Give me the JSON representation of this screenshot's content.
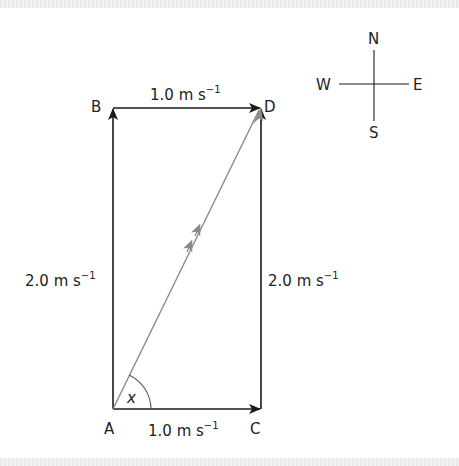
{
  "diagram": {
    "points": {
      "A": {
        "label": "A",
        "x": 113,
        "y": 409
      },
      "B": {
        "label": "B",
        "x": 113,
        "y": 108
      },
      "C": {
        "label": "C",
        "x": 261,
        "y": 409
      },
      "D": {
        "label": "D",
        "x": 261,
        "y": 108
      }
    },
    "vectors": [
      {
        "from": "A",
        "to": "B",
        "magnitude": "2.0",
        "unit": "m s",
        "exponent": "−1"
      },
      {
        "from": "B",
        "to": "D",
        "magnitude": "1.0",
        "unit": "m s",
        "exponent": "−1"
      },
      {
        "from": "A",
        "to": "C",
        "magnitude": "1.0",
        "unit": "m s",
        "exponent": "−1"
      },
      {
        "from": "C",
        "to": "D",
        "magnitude": "2.0",
        "unit": "m s",
        "exponent": "−1"
      },
      {
        "from": "A",
        "to": "D",
        "magnitude": "",
        "unit": "",
        "exponent": "",
        "style": "resultant"
      }
    ],
    "angle_label": "x",
    "compass": {
      "N": "N",
      "S": "S",
      "E": "E",
      "W": "W"
    },
    "colors": {
      "line": "#1a1a1a",
      "resultant": "#8a8a8a"
    }
  }
}
